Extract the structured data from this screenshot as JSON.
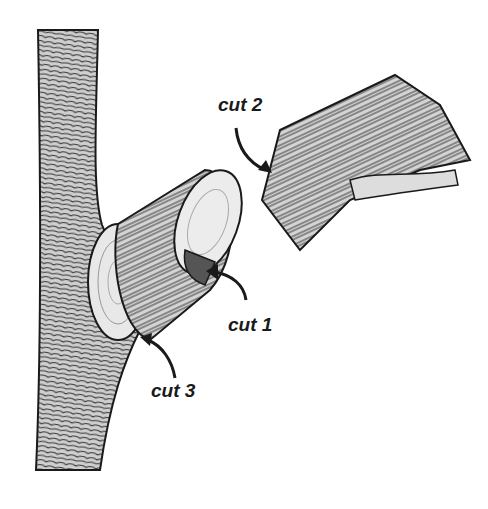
{
  "diagram": {
    "labels": {
      "cut1": "cut 1",
      "cut2": "cut 2",
      "cut3": "cut 3"
    },
    "colors": {
      "ink": "#1a1a1a",
      "bark": "#8a8a8a",
      "wood": "#e6e6e6",
      "background": "#ffffff"
    }
  }
}
